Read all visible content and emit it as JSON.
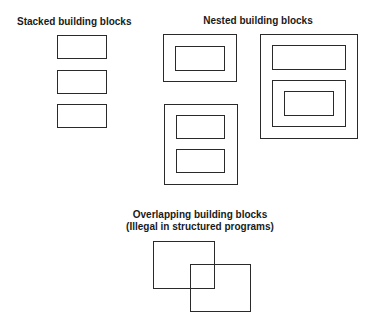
{
  "stacked": {
    "title": "Stacked building blocks"
  },
  "nested": {
    "title": "Nested building blocks"
  },
  "overlapping": {
    "title_line1": "Overlapping building blocks",
    "title_line2": "(Illegal in structured programs)"
  }
}
